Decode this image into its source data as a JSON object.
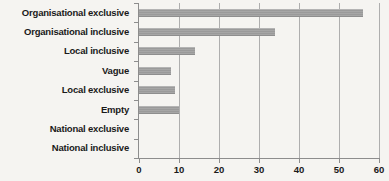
{
  "chart_data": {
    "type": "bar",
    "orientation": "horizontal",
    "title": "",
    "subtitle": "",
    "xlabel": "",
    "ylabel": "",
    "categories": [
      "Organisational exclusive",
      "Organisational inclusive",
      "Local inclusive",
      "Vague",
      "Local exclusive",
      "Empty",
      "National exclusive",
      "National inclusive"
    ],
    "values": [
      56,
      34,
      14,
      8,
      9,
      10,
      0,
      0
    ],
    "xlim": [
      0,
      60
    ],
    "xticks": [
      0,
      10,
      20,
      30,
      40,
      50,
      60
    ],
    "xtick_labels": [
      "0",
      "10",
      "20",
      "30",
      "40",
      "50",
      "60"
    ],
    "grid": "vertical",
    "legend": "none",
    "series": [
      {
        "name": "",
        "values": [
          56,
          34,
          14,
          8,
          9,
          10,
          0,
          0
        ]
      }
    ]
  },
  "colors": {
    "background": "#f5f4f1",
    "bar": "#9d9d9d",
    "gridline": "#aeaeae",
    "axis": "#8d8d8d",
    "text": "#1a1a1a"
  }
}
